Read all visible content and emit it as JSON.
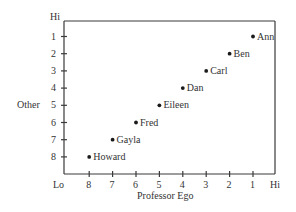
{
  "chart_data": {
    "type": "scatter",
    "title": "",
    "xlabel": "Professor Ego",
    "ylabel": "Other",
    "x_axis": {
      "low_label": "Lo",
      "high_label": "Hi",
      "ticks": [
        8,
        7,
        6,
        5,
        4,
        3,
        2,
        1
      ],
      "reversed": true
    },
    "y_axis": {
      "high_label": "Hi",
      "ticks": [
        1,
        2,
        3,
        4,
        5,
        6,
        7,
        8
      ],
      "reversed": true
    },
    "grid": false,
    "legend": null,
    "points": [
      {
        "label": "Ann",
        "x": 1,
        "y": 1
      },
      {
        "label": "Ben",
        "x": 2,
        "y": 2
      },
      {
        "label": "Carl",
        "x": 3,
        "y": 3
      },
      {
        "label": "Dan",
        "x": 4,
        "y": 4
      },
      {
        "label": "Eileen",
        "x": 5,
        "y": 5
      },
      {
        "label": "Fred",
        "x": 6,
        "y": 6
      },
      {
        "label": "Gayla",
        "x": 7,
        "y": 7
      },
      {
        "label": "Howard",
        "x": 8,
        "y": 8
      }
    ]
  },
  "colors": {
    "axis": "#3a3a3a",
    "text": "#333333",
    "point": "#1a1a1a"
  }
}
